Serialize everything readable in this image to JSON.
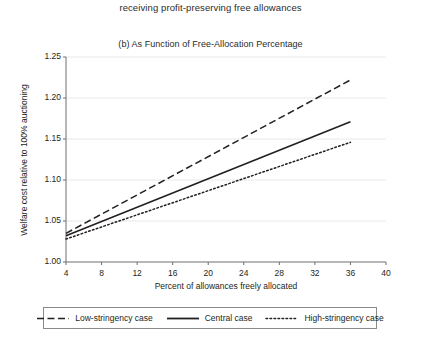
{
  "figure": {
    "caption_tail": "receiving profit-preserving free allowances",
    "panel_title": "(b) As Function of Free-Allocation Percentage"
  },
  "chart_data": {
    "type": "line",
    "title": "(b) As Function of Free-Allocation Percentage",
    "xlabel": "Percent of allowances freely allocated",
    "ylabel": "Welfare cost relative to 100% auctioning",
    "xlim": [
      4,
      40
    ],
    "ylim": [
      1.0,
      1.25
    ],
    "xticks": [
      4,
      8,
      12,
      16,
      20,
      24,
      28,
      32,
      36,
      40
    ],
    "xtick_labels": [
      "4",
      "8",
      "12",
      "16",
      "20",
      "24",
      "28",
      "32",
      "36",
      "40"
    ],
    "yticks": [
      1.0,
      1.05,
      1.1,
      1.15,
      1.2,
      1.25
    ],
    "ytick_labels": [
      "1.00",
      "1.05",
      "1.10",
      "1.15",
      "1.20",
      "1.25"
    ],
    "grid": "horizontal",
    "legend_position": "below-plot",
    "line_color": "#231f20",
    "grid_color": "#e8e8e8",
    "axis_color": "#6e6e6e",
    "x": [
      4,
      36
    ],
    "series": [
      {
        "name": "Low-stringency case",
        "style": "dashed",
        "values": [
          1.035,
          1.222
        ]
      },
      {
        "name": "Central case",
        "style": "solid",
        "values": [
          1.032,
          1.171
        ]
      },
      {
        "name": "High-stringency case",
        "style": "dotted",
        "values": [
          1.028,
          1.146
        ]
      }
    ]
  },
  "legend": {
    "items": [
      {
        "label": "Low-stringency case",
        "style": "dashed"
      },
      {
        "label": "Central case",
        "style": "solid"
      },
      {
        "label": "High-stringency case",
        "style": "dotted"
      }
    ]
  }
}
